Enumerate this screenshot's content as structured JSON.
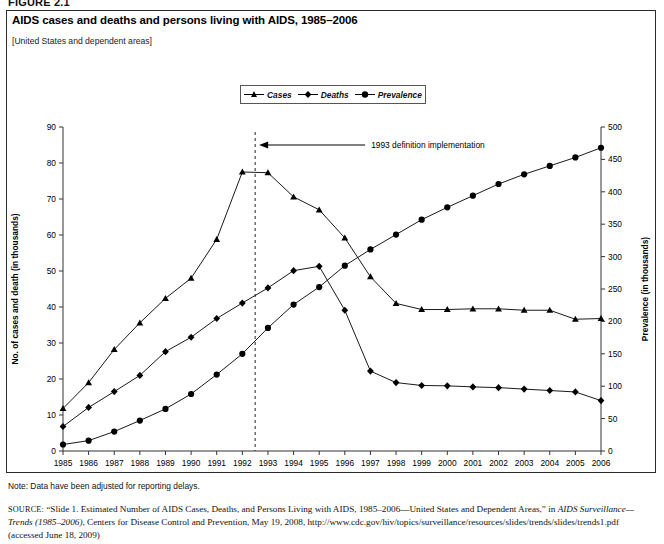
{
  "figure": {
    "label": "FIGURE 2.1",
    "title": "AIDS cases and deaths and persons living with AIDS, 1985–2006",
    "subtitle": "[United States and dependent areas]"
  },
  "legend": {
    "items": [
      {
        "label": "Cases",
        "marker": "triangle-marker",
        "color": "#000000"
      },
      {
        "label": "Deaths",
        "marker": "diamond-marker",
        "color": "#000000"
      },
      {
        "label": "Prevalence",
        "marker": "circle-marker",
        "color": "#000000"
      }
    ]
  },
  "annotation": {
    "text": "1993 definition implementation",
    "at_year": 1992.5
  },
  "footer": {
    "note": "Note: Data have been adjusted for reporting delays.",
    "source_label": "SOURCE:",
    "source_p1": " “Slide 1. Estimated Number of AIDS Cases, Deaths, and Persons Living with AIDS, 1985–2006—United States and Dependent Areas,” in ",
    "source_it1": "AIDS Surveillance—Trends (1985–2006)",
    "source_p2": ", Centers for Disease Control and Prevention, May 19, 2008, http://www.cdc.gov/hiv/topics/surveillance/resources/slides/trends/slides/trends1.pdf (accessed June 18, 2009)"
  },
  "chart_data": {
    "type": "line",
    "title": "AIDS cases and deaths and persons living with AIDS, 1985–2006",
    "xlabel": "Year of diagnosis or death",
    "ylabel": "No. of cases and death (in thousands)",
    "y2label": "Prevalence (in thousands)",
    "grid": false,
    "legend_position": "top-center",
    "x": [
      1985,
      1986,
      1987,
      1988,
      1989,
      1990,
      1991,
      1992,
      1993,
      1994,
      1995,
      1996,
      1997,
      1998,
      1999,
      2000,
      2001,
      2002,
      2003,
      2004,
      2005,
      2006
    ],
    "xlim": [
      1985,
      2006
    ],
    "ylim": [
      0,
      90
    ],
    "yticks": [
      0,
      10,
      20,
      30,
      40,
      50,
      60,
      70,
      80,
      90
    ],
    "y2lim": [
      0,
      500
    ],
    "y2ticks": [
      0,
      50,
      100,
      150,
      200,
      250,
      300,
      350,
      400,
      450,
      500
    ],
    "series": [
      {
        "name": "Cases",
        "axis": "left",
        "units": "thousands",
        "marker": "triangle",
        "values": [
          11.8,
          19.0,
          28.2,
          35.6,
          42.4,
          48.0,
          58.8,
          77.5,
          77.3,
          70.6,
          67.0,
          59.2,
          48.4,
          41.0,
          39.3,
          39.3,
          39.5,
          39.5,
          39.1,
          39.1,
          36.6,
          36.8
        ]
      },
      {
        "name": "Deaths",
        "axis": "left",
        "units": "thousands",
        "marker": "diamond",
        "values": [
          6.8,
          12.1,
          16.5,
          21.0,
          27.6,
          31.6,
          36.8,
          41.1,
          45.3,
          50.1,
          51.3,
          39.1,
          22.2,
          19.0,
          18.2,
          18.1,
          17.8,
          17.6,
          17.2,
          16.8,
          16.4,
          14.0
        ]
      },
      {
        "name": "Prevalence",
        "axis": "right",
        "units": "thousands",
        "marker": "circle",
        "values": [
          10,
          16,
          30,
          47,
          65,
          88,
          118,
          150,
          190,
          226,
          253,
          286,
          311,
          334,
          357,
          376,
          394,
          412,
          427,
          440,
          453,
          468
        ]
      }
    ]
  }
}
